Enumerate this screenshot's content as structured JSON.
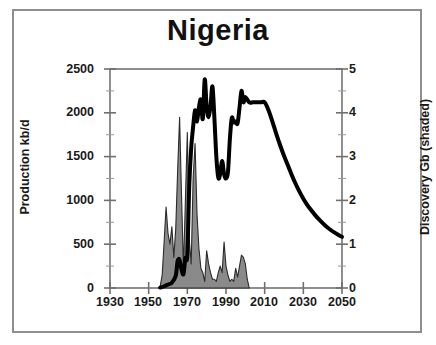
{
  "figure": {
    "title": "Nigeria",
    "border_color": "#8e8e8e",
    "background": "#ffffff"
  },
  "chart_data": {
    "type": "area",
    "title": "Nigeria",
    "xlabel": "",
    "ylabel": "Production kb/d",
    "y2label": "Discovery Gb (shaded)",
    "xlim": [
      1930,
      2050
    ],
    "ylim": [
      0,
      2500
    ],
    "y2lim": [
      0,
      5
    ],
    "grid": false,
    "legend": "none",
    "xticks": [
      1930,
      1950,
      1970,
      1990,
      2010,
      2030,
      2050
    ],
    "xtick_labels": [
      "1930",
      "1950",
      "1970",
      "1990",
      "2010",
      "2030",
      "2050"
    ],
    "xminor_step": 10,
    "yticks": [
      0,
      500,
      1000,
      1500,
      2000,
      2500
    ],
    "ytick_labels": [
      "0",
      "500",
      "1000",
      "1500",
      "2000",
      "2500"
    ],
    "yminor_step": 250,
    "y2ticks": [
      0,
      1,
      2,
      3,
      4,
      5
    ],
    "y2tick_labels": [
      "0",
      "1",
      "2",
      "3",
      "4",
      "5"
    ],
    "y2minor_step": 0.5,
    "series": [
      {
        "name": "Production kb/d",
        "axis": "left",
        "style": "line",
        "color": "#000000",
        "linewidth": 4,
        "units": "kb/d",
        "x": [
          1956,
          1958,
          1960,
          1962,
          1964,
          1965,
          1966,
          1967,
          1968,
          1969,
          1970,
          1971,
          1972,
          1973,
          1974,
          1975,
          1976,
          1977,
          1978,
          1979,
          1980,
          1981,
          1982,
          1983,
          1984,
          1985,
          1986,
          1987,
          1988,
          1989,
          1990,
          1991,
          1992,
          1993,
          1994,
          1995,
          1996,
          1997,
          1998,
          1999,
          2000,
          2002,
          2004,
          2006,
          2008,
          2010,
          2012,
          2014,
          2016,
          2018,
          2020,
          2022,
          2024,
          2026,
          2028,
          2030,
          2032,
          2034,
          2036,
          2038,
          2040,
          2042,
          2044,
          2046,
          2048,
          2050
        ],
        "y": [
          5,
          20,
          40,
          60,
          140,
          310,
          320,
          210,
          160,
          340,
          380,
          1170,
          1600,
          1840,
          2030,
          1900,
          2060,
          2150,
          1930,
          2380,
          2070,
          1950,
          2080,
          2300,
          1940,
          1500,
          1260,
          1300,
          1450,
          1300,
          1250,
          1320,
          1700,
          1940,
          1890,
          1900,
          1880,
          2060,
          2250,
          2120,
          2180,
          2120,
          2120,
          2120,
          2120,
          2120,
          2030,
          1900,
          1760,
          1630,
          1510,
          1400,
          1290,
          1190,
          1100,
          1020,
          950,
          890,
          835,
          785,
          740,
          700,
          665,
          635,
          608,
          585
        ]
      },
      {
        "name": "Discovery Gb (shaded)",
        "axis": "right",
        "style": "area-filled",
        "fill_color": "#8a8a8a",
        "edge_color": "#2b2b2b",
        "units": "Gb",
        "x": [
          1955,
          1956,
          1957,
          1958,
          1959,
          1960,
          1961,
          1962,
          1963,
          1964,
          1965,
          1966,
          1967,
          1968,
          1969,
          1970,
          1971,
          1972,
          1973,
          1974,
          1975,
          1976,
          1977,
          1978,
          1979,
          1980,
          1981,
          1982,
          1983,
          1984,
          1985,
          1986,
          1987,
          1988,
          1989,
          1990,
          1991,
          1992,
          1993,
          1994,
          1995,
          1996,
          1997,
          1998,
          1999,
          2000,
          2001,
          2002
        ],
        "y": [
          0.0,
          0.05,
          0.3,
          1.05,
          1.85,
          1.25,
          1.0,
          1.4,
          0.7,
          1.35,
          2.7,
          3.9,
          2.1,
          0.45,
          2.0,
          3.55,
          1.1,
          0.55,
          2.5,
          3.3,
          1.7,
          0.9,
          0.45,
          0.35,
          0.15,
          0.85,
          0.55,
          0.35,
          0.2,
          0.2,
          0.15,
          0.35,
          0.5,
          0.35,
          1.05,
          0.5,
          0.3,
          0.15,
          0.2,
          0.15,
          0.45,
          0.25,
          0.5,
          0.75,
          0.7,
          0.55,
          0.2,
          0.0
        ]
      }
    ],
    "annotations": []
  }
}
